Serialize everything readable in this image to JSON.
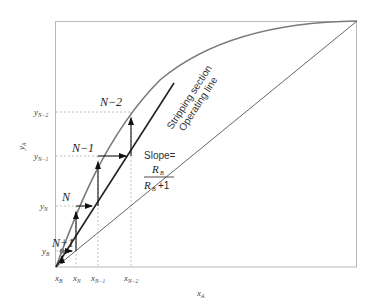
{
  "diagram": {
    "axes": {
      "x_label": "x",
      "x_label_sub": "A",
      "y_label": "y",
      "y_label_sub": "A"
    },
    "x_ticks": [
      {
        "base": "x",
        "sub": "B"
      },
      {
        "base": "x",
        "sub": "N"
      },
      {
        "base": "x",
        "sub": "N−1"
      },
      {
        "base": "x",
        "sub": "N−2"
      }
    ],
    "y_ticks": [
      {
        "base": "y",
        "sub": "B"
      },
      {
        "base": "y",
        "sub": "N"
      },
      {
        "base": "y",
        "sub": "N−1"
      },
      {
        "base": "y",
        "sub": "N−2"
      }
    ],
    "stage_labels": [
      "N+1",
      "N",
      "N−1",
      "N−2"
    ],
    "operating_line_label_1": "Stripping section",
    "operating_line_label_2": "Operating line",
    "slope": {
      "prefix": "Slope=",
      "numerator": "R",
      "numerator_sub": "B",
      "denominator": "R",
      "denominator_sub": "B",
      "denominator_suffix": "+1"
    },
    "colors": {
      "curve": "#707070",
      "lines": "#333333",
      "dashed": "#b0b0b0",
      "frame": "#b8b8b8"
    }
  }
}
